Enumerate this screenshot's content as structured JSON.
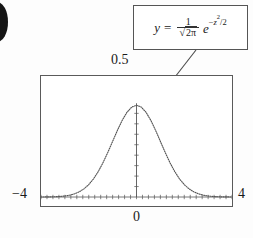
{
  "figure": {
    "artifact_name": "page-edge-blob"
  },
  "callout": {
    "formula_plain": "y = 1/sqrt(2*pi) * e^(-z^2/2)",
    "y_symbol": "y",
    "equals": "=",
    "numerator": "1",
    "denominator_radical": "√",
    "denominator_body": "2π",
    "exp_base": "e",
    "exp_sign": "−",
    "exp_var": "z",
    "exp_power": "2",
    "exp_divisor": "/2"
  },
  "labels": {
    "top": "0.5",
    "left": "−4",
    "right": "4",
    "bottom": "0"
  },
  "chart_data": {
    "type": "line",
    "title": "",
    "subtitle": "",
    "xlabel": "",
    "ylabel": "",
    "xlim": [
      -4,
      4
    ],
    "ylim": [
      0,
      0.5
    ],
    "grid": false,
    "legend": false,
    "legend_position": "none",
    "line_style": "dotted",
    "line_color": "#555555",
    "frame_color": "#5a5a5a",
    "annotations": [
      {
        "text": "y = 1/sqrt(2*pi) e^(-z^2/2)",
        "type": "callout-box",
        "points_to_x": 0.35,
        "points_to_y": 0.37
      }
    ],
    "axis_ticks": {
      "x_tick_count": 33,
      "y_tick_count": 10,
      "x_axis_at_y": 0,
      "y_axis_at_x": 0
    },
    "series": [
      {
        "name": "standard normal pdf",
        "x": [
          -4,
          -3.8,
          -3.6,
          -3.4,
          -3.2,
          -3,
          -2.8,
          -2.6,
          -2.4,
          -2.2,
          -2,
          -1.8,
          -1.6,
          -1.4,
          -1.2,
          -1,
          -0.8,
          -0.6,
          -0.4,
          -0.2,
          0,
          0.2,
          0.4,
          0.6,
          0.8,
          1,
          1.2,
          1.4,
          1.6,
          1.8,
          2,
          2.2,
          2.4,
          2.6,
          2.8,
          3,
          3.2,
          3.4,
          3.6,
          3.8,
          4
        ],
        "values": [
          0.0001,
          0.0003,
          0.0006,
          0.0012,
          0.0024,
          0.0044,
          0.0079,
          0.0136,
          0.0224,
          0.0355,
          0.054,
          0.079,
          0.1109,
          0.1497,
          0.1942,
          0.242,
          0.2897,
          0.3332,
          0.3683,
          0.391,
          0.3989,
          0.391,
          0.3683,
          0.3332,
          0.2897,
          0.242,
          0.1942,
          0.1497,
          0.1109,
          0.079,
          0.054,
          0.0355,
          0.0224,
          0.0136,
          0.0079,
          0.0044,
          0.0024,
          0.0012,
          0.0006,
          0.0003,
          0.0001
        ]
      }
    ],
    "peak": {
      "x": 0,
      "y": 0.3989
    }
  }
}
